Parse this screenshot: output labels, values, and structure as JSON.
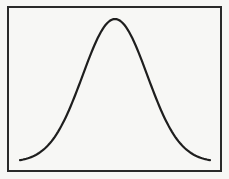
{
  "chart_data": {
    "type": "line",
    "title": "",
    "xlabel": "",
    "ylabel": "",
    "grid": false,
    "legend": null,
    "x": [
      0,
      0.1,
      0.2,
      0.3,
      0.4,
      0.5,
      0.6,
      0.7,
      0.8,
      0.9,
      1.0
    ],
    "series": [
      {
        "name": "curve",
        "values": [
          0.02,
          0.08,
          0.25,
          0.58,
          0.92,
          1.0,
          0.92,
          0.58,
          0.25,
          0.08,
          0.02
        ]
      }
    ],
    "ylim": [
      0,
      1.05
    ],
    "colors": {
      "line": "#1e1e1e",
      "frame": "#2a2a2a",
      "background": "#f7f7f5"
    }
  }
}
